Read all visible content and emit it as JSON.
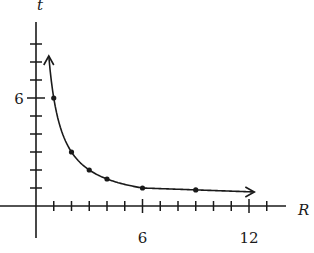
{
  "chart_data": {
    "type": "line",
    "title": "",
    "xlabel": "R",
    "ylabel": "t",
    "xlim": [
      0,
      13
    ],
    "ylim": [
      0,
      9.5
    ],
    "x_ticks_every": 1,
    "y_ticks_every": 1,
    "x_tick_labels": [
      {
        "value": 6,
        "label": "6"
      },
      {
        "value": 12,
        "label": "12"
      }
    ],
    "y_tick_labels": [
      {
        "value": 6,
        "label": "6"
      }
    ],
    "grid": false,
    "legend": null,
    "series": [
      {
        "name": "t = 6/R",
        "curve": "6/R",
        "curve_range": [
          0.72,
          12.3
        ],
        "arrows": "both",
        "points": [
          {
            "x": 1,
            "y": 6
          },
          {
            "x": 2,
            "y": 3
          },
          {
            "x": 3,
            "y": 2
          },
          {
            "x": 4,
            "y": 1.5
          },
          {
            "x": 6,
            "y": 1
          },
          {
            "x": 9,
            "y": 0.67
          }
        ]
      }
    ]
  },
  "colors": {
    "ink": "#1a1a1a",
    "background": "#ffffff"
  }
}
